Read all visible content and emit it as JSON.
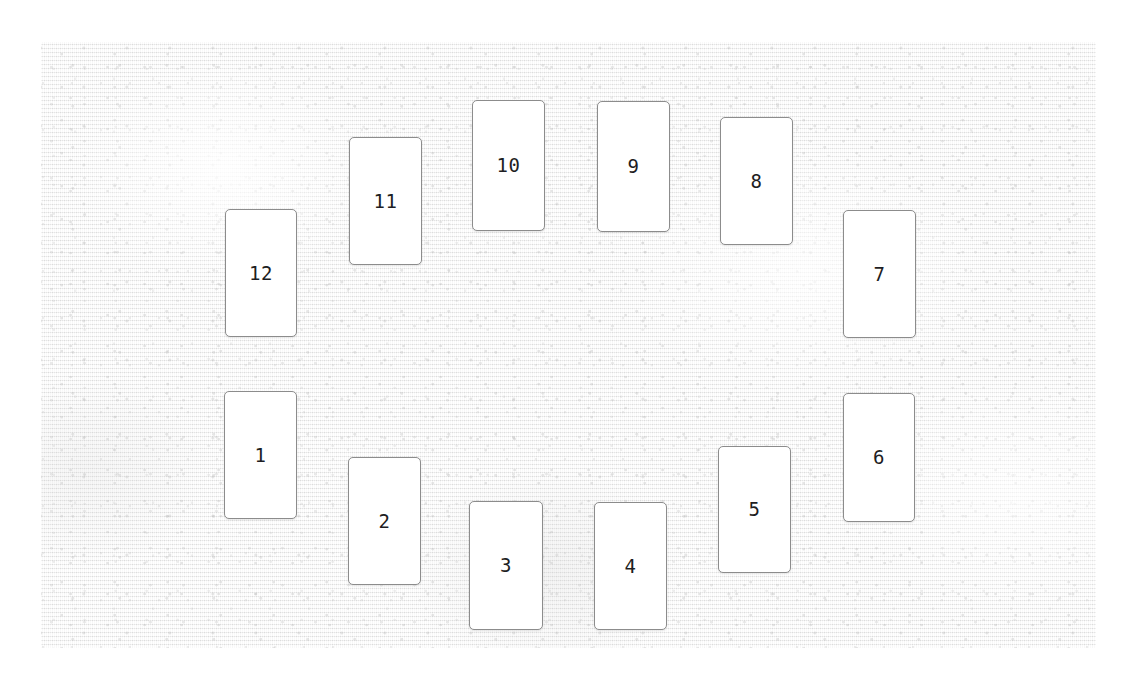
{
  "scene": {
    "width": 1137,
    "height": 688,
    "page_background": "#ffffff",
    "title": "Playing card layout on textured surface"
  },
  "surface": {
    "name": "textured-table-surface",
    "x": 41,
    "y": 42,
    "width": 1055,
    "height": 606,
    "base_color": "#f2f2f2",
    "texture": "fine vertical fabric weave with speckle"
  },
  "card_style": {
    "fill": "#ffffff",
    "border_color": "#8c8c8c",
    "border_width": 1,
    "corner_radius": 5,
    "label_color": "#1e1e23",
    "label_font_size": 19
  },
  "cards": [
    {
      "label": "12",
      "x": 225,
      "y": 209,
      "width": 72,
      "height": 128
    },
    {
      "label": "11",
      "x": 349,
      "y": 137,
      "width": 73,
      "height": 128
    },
    {
      "label": "10",
      "x": 472,
      "y": 100,
      "width": 73,
      "height": 131
    },
    {
      "label": "9",
      "x": 597,
      "y": 101,
      "width": 73,
      "height": 131
    },
    {
      "label": "8",
      "x": 720,
      "y": 117,
      "width": 73,
      "height": 128
    },
    {
      "label": "7",
      "x": 843,
      "y": 210,
      "width": 73,
      "height": 128
    },
    {
      "label": "6",
      "x": 843,
      "y": 393,
      "width": 72,
      "height": 129
    },
    {
      "label": "5",
      "x": 718,
      "y": 446,
      "width": 73,
      "height": 127
    },
    {
      "label": "4",
      "x": 594,
      "y": 502,
      "width": 73,
      "height": 128
    },
    {
      "label": "3",
      "x": 469,
      "y": 501,
      "width": 74,
      "height": 129
    },
    {
      "label": "2",
      "x": 348,
      "y": 457,
      "width": 73,
      "height": 128
    },
    {
      "label": "1",
      "x": 224,
      "y": 391,
      "width": 73,
      "height": 128
    }
  ]
}
